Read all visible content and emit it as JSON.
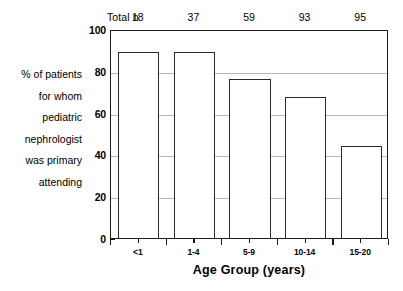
{
  "chart_data": {
    "type": "bar",
    "title": "",
    "subtitle": "",
    "xlabel": "Age Group (years)",
    "ylabel": "% of patients for whom pediatric nephrologist was primary attending",
    "categories": [
      "<1",
      "1-4",
      "5-9",
      "10-14",
      "15-20"
    ],
    "values": [
      89,
      89,
      76,
      67.5,
      44
    ],
    "ylim": [
      0,
      100
    ],
    "yticks": [
      0,
      20,
      40,
      60,
      80,
      100
    ],
    "grid": true,
    "legend": "none",
    "series": [
      {
        "name": "% of patients for whom pediatric nephrologist was primary attending",
        "values": [
          89,
          89,
          76,
          67.5,
          44
        ]
      }
    ],
    "annotations": {
      "total_n_label": "Total n",
      "total_n_values": [
        18,
        37,
        59,
        93,
        95
      ]
    },
    "bar_fill_color": "#ffffff",
    "bar_edge_color": "#2b2b2b",
    "grid_color": "#b9b9b9",
    "axis_color": "#1a1a1a"
  },
  "totaln": {
    "label": "Total n",
    "values": [
      "18",
      "37",
      "59",
      "93",
      "95"
    ]
  },
  "yaxis": {
    "ticks": [
      "100",
      "80",
      "60",
      "40",
      "20",
      "0"
    ]
  },
  "xaxis": {
    "title": "Age Group (years)",
    "ticks": [
      "<1",
      "1-4",
      "5-9",
      "10-14",
      "15-20"
    ]
  },
  "ylabel_lines": [
    "% of patients",
    "for whom",
    "pediatric",
    "nephrologist",
    "was primary",
    "attending"
  ]
}
